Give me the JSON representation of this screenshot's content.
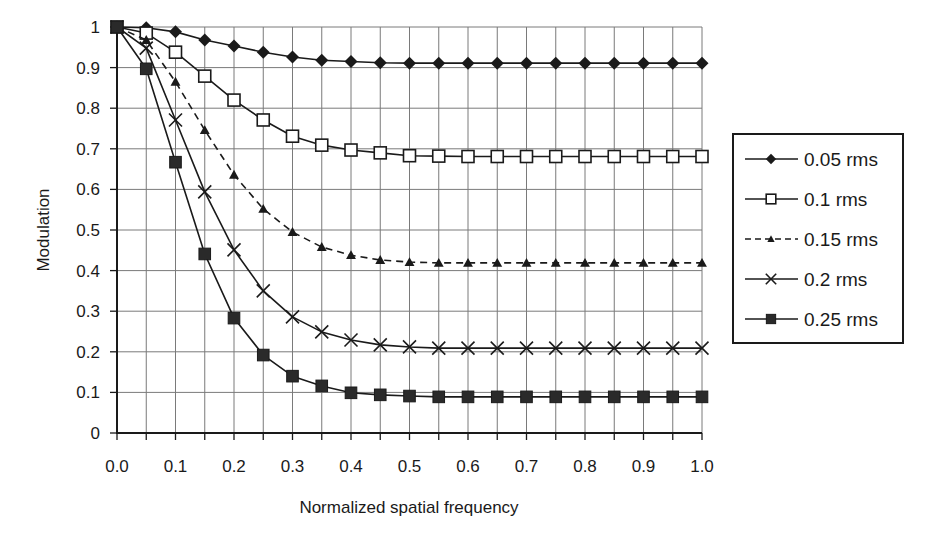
{
  "chart_data": {
    "type": "line",
    "title": "",
    "xlabel": "Normalized spatial frequency",
    "ylabel": "Modulation",
    "xlim": [
      0.0,
      1.0
    ],
    "ylim": [
      0,
      1
    ],
    "grid": true,
    "legend_position": "right",
    "x_ticks": [
      "0.0",
      "0.1",
      "0.2",
      "0.3",
      "0.4",
      "0.5",
      "0.6",
      "0.7",
      "0.8",
      "0.9",
      "1.0"
    ],
    "y_ticks": [
      "0",
      "0.1",
      "0.2",
      "0.3",
      "0.4",
      "0.5",
      "0.6",
      "0.7",
      "0.8",
      "0.9",
      "1"
    ],
    "x": [
      0.0,
      0.05,
      0.1,
      0.15,
      0.2,
      0.25,
      0.3,
      0.35,
      0.4,
      0.45,
      0.5,
      0.55,
      0.6,
      0.65,
      0.7,
      0.75,
      0.8,
      0.85,
      0.9,
      0.95,
      1.0
    ],
    "series": [
      {
        "name": "0.05 rms",
        "marker": "diamond",
        "line": "solid",
        "values": [
          1.0,
          0.998,
          0.988,
          0.968,
          0.953,
          0.938,
          0.926,
          0.918,
          0.915,
          0.912,
          0.911,
          0.911,
          0.911,
          0.911,
          0.911,
          0.911,
          0.911,
          0.911,
          0.911,
          0.911,
          0.911
        ]
      },
      {
        "name": "0.1 rms",
        "marker": "open-square",
        "line": "solid",
        "values": [
          1.0,
          0.985,
          0.938,
          0.879,
          0.82,
          0.771,
          0.731,
          0.709,
          0.697,
          0.69,
          0.683,
          0.682,
          0.681,
          0.681,
          0.681,
          0.681,
          0.681,
          0.681,
          0.681,
          0.681,
          0.681
        ]
      },
      {
        "name": "0.15 rms",
        "marker": "triangle",
        "line": "dashed",
        "values": [
          1.0,
          0.968,
          0.865,
          0.746,
          0.636,
          0.552,
          0.495,
          0.458,
          0.438,
          0.426,
          0.421,
          0.419,
          0.419,
          0.419,
          0.419,
          0.419,
          0.419,
          0.419,
          0.419,
          0.419,
          0.419
        ]
      },
      {
        "name": "0.2 rms",
        "marker": "x",
        "line": "solid",
        "values": [
          1.0,
          0.948,
          0.771,
          0.594,
          0.451,
          0.35,
          0.286,
          0.249,
          0.229,
          0.217,
          0.212,
          0.209,
          0.209,
          0.209,
          0.209,
          0.209,
          0.209,
          0.209,
          0.209,
          0.209,
          0.209
        ]
      },
      {
        "name": "0.25 rms",
        "marker": "filled-square",
        "line": "solid",
        "values": [
          1.0,
          0.897,
          0.667,
          0.441,
          0.283,
          0.192,
          0.14,
          0.116,
          0.099,
          0.094,
          0.091,
          0.089,
          0.089,
          0.089,
          0.089,
          0.089,
          0.089,
          0.089,
          0.089,
          0.089,
          0.089
        ]
      }
    ]
  },
  "colors": {
    "line": "#1a1a1a",
    "grid": "#7a7a7a",
    "background": "#ffffff"
  }
}
